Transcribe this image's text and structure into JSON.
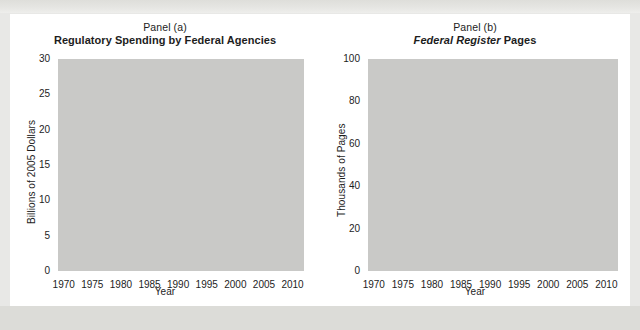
{
  "figure": {
    "xlabel": "Year",
    "panels": [
      {
        "id": "panel-a",
        "panel_label": "Panel (a)",
        "title": "Regulatory Spending by Federal Agencies",
        "title_italic_part": "",
        "ylabel": "Billions of 2005 Dollars"
      },
      {
        "id": "panel-b",
        "panel_label": "Panel (b)",
        "title_italic_part": "Federal Register",
        "title_rest": " Pages",
        "ylabel": "Thousands of Pages"
      }
    ]
  },
  "chart_data": [
    {
      "type": "line",
      "id": "panel-a",
      "title": "Regulatory Spending by Federal Agencies",
      "subtitle": "Panel (a)",
      "xlabel": "Year",
      "ylabel": "Billions of 2005 Dollars",
      "xlim": [
        1969,
        2012
      ],
      "ylim": [
        0,
        30
      ],
      "yticks": [
        0,
        5,
        10,
        15,
        20,
        25,
        30
      ],
      "xticks": [
        1970,
        1975,
        1980,
        1985,
        1990,
        1995,
        2000,
        2005,
        2010
      ],
      "grid": "horizontal-dotted",
      "legend": "none",
      "note": "series is clipped at the top of the axis after 2002; final plotted point exits above y=30",
      "x": [
        1970,
        1971,
        1972,
        1973,
        1974,
        1975,
        1976,
        1977,
        1978,
        1979,
        1980,
        1981,
        1982,
        1983,
        1984,
        1985,
        1986,
        1987,
        1988,
        1989,
        1990,
        1991,
        1992,
        1993,
        1994,
        1995,
        1996,
        1997,
        1998,
        1999,
        2000,
        2001,
        2002,
        2003
      ],
      "values": [
        5.8,
        6.6,
        7.6,
        8.6,
        9.9,
        10.0,
        9.9,
        10.5,
        10.8,
        10.6,
        11.4,
        12.1,
        13.4,
        13.8,
        13.2,
        12.4,
        11.9,
        12.3,
        13.0,
        12.9,
        13.2,
        14.2,
        15.3,
        16.3,
        17.5,
        18.5,
        18.9,
        18.9,
        18.5,
        18.1,
        18.4,
        19.2,
        19.5,
        25.0
      ],
      "series_name": "Regulatory spending"
    },
    {
      "type": "line",
      "id": "panel-b",
      "title": "Federal Register Pages",
      "subtitle": "Panel (b)",
      "xlabel": "Year",
      "ylabel": "Thousands of Pages",
      "xlim": [
        1969,
        2012
      ],
      "ylim": [
        0,
        100
      ],
      "yticks": [
        0,
        20,
        40,
        60,
        80,
        100
      ],
      "xticks": [
        1970,
        1975,
        1980,
        1985,
        1990,
        1995,
        2000,
        2005,
        2010
      ],
      "grid": "horizontal-dotted",
      "legend": "none",
      "x": [
        1970,
        1971,
        1972,
        1973,
        1974,
        1975,
        1976,
        1977,
        1978,
        1979,
        1980,
        1981,
        1982,
        1983,
        1984,
        1985,
        1986,
        1987,
        1988,
        1989,
        1990,
        1991,
        1992,
        1993,
        1994,
        1995,
        1996,
        1997,
        1998,
        1999,
        2000,
        2001,
        2002,
        2003,
        2004
      ],
      "values": [
        21.0,
        25.5,
        28.9,
        35.6,
        45.4,
        60.2,
        57.1,
        65.6,
        61.3,
        77.5,
        88.5,
        63.6,
        58.5,
        57.7,
        50.9,
        53.5,
        47.4,
        49.7,
        53.4,
        53.8,
        53.6,
        67.7,
        62.0,
        69.7,
        68.1,
        62.6,
        64.6,
        64.5,
        68.6,
        71.2,
        83.3,
        67.7,
        75.6,
        75.8,
        77.0
      ],
      "series_name": "Federal Register pages"
    }
  ]
}
